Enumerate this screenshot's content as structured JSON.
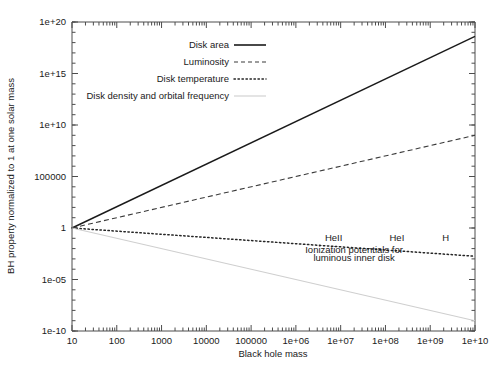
{
  "chart_data": {
    "type": "line",
    "title": "",
    "xlabel": "Black hole mass",
    "ylabel": "BH property normalized to 1 at one solar mass",
    "xscale": "log",
    "yscale": "log",
    "xlim": [
      10,
      10000000000
    ],
    "ylim": [
      1e-10,
      1e+20
    ],
    "grid": false,
    "legend_position": "upper-left-inside",
    "xticklabels": [
      "10",
      "100",
      "1000",
      "10000",
      "100000",
      "1e+06",
      "1e+07",
      "1e+08",
      "1e+09",
      "1e+10"
    ],
    "xtickvalues": [
      10,
      100,
      1000,
      10000,
      100000,
      1000000,
      10000000,
      100000000,
      1000000000,
      10000000000
    ],
    "yticklabels": [
      "1e+20",
      "1e+15",
      "1e+10",
      "100000",
      "1",
      "1e-05",
      "1e-10"
    ],
    "ytickvalues": [
      1e+20,
      1000000000000000.0,
      10000000000.0,
      100000,
      1,
      1e-05,
      1e-10
    ],
    "series": [
      {
        "name": "Disk area",
        "style": "solid",
        "x": [
          10,
          10000000000
        ],
        "y": [
          1,
          4e+18
        ]
      },
      {
        "name": "Luminosity",
        "style": "dashed",
        "x": [
          10,
          10000000000
        ],
        "y": [
          1,
          1000000000.0
        ]
      },
      {
        "name": "Disk temperature",
        "style": "dotted",
        "x": [
          10,
          10000000000
        ],
        "y": [
          1,
          0.0018
        ]
      },
      {
        "name": "Disk density and orbital frequency",
        "style": "light-solid",
        "x": [
          10,
          10000000000
        ],
        "y": [
          1,
          1e-09
        ]
      }
    ],
    "annotations": [
      {
        "text": "HeII",
        "x": 7000000,
        "y": 0.06
      },
      {
        "text": "HeI",
        "x": 180000000,
        "y": 0.06
      },
      {
        "text": "H",
        "x": 2200000000,
        "y": 0.06
      },
      {
        "text": "Ionization potentials for",
        "x": 20000000,
        "y": 0.0035
      },
      {
        "text": "luminous inner disk",
        "x": 20000000,
        "y": 0.00065
      }
    ]
  },
  "legend": {
    "items": [
      {
        "label": "Disk area",
        "style": "solid"
      },
      {
        "label": "Luminosity",
        "style": "dashed"
      },
      {
        "label": "Disk temperature",
        "style": "dotted"
      },
      {
        "label": "Disk density and orbital frequency",
        "style": "light-solid"
      }
    ]
  }
}
